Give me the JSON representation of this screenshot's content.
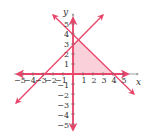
{
  "diagram": {
    "type": "coordinate-plane",
    "x_axis_label": "x",
    "y_axis_label": "y",
    "x_ticks": [
      "−5",
      "−4",
      "−3",
      "−2",
      "−1",
      "1",
      "2",
      "3",
      "4",
      "5"
    ],
    "y_ticks": [
      "5",
      "4",
      "3",
      "2",
      "1",
      "−1",
      "−2",
      "−3",
      "−4",
      "−5"
    ],
    "lines": [
      {
        "name": "rising-line",
        "equation": "y = x + 3"
      },
      {
        "name": "falling-line",
        "equation": "y = -x + 4"
      }
    ],
    "shaded_region": "x ≥ 0, y ≥ 0, y ≤ x + 3, y ≤ -x + 4",
    "colors": {
      "line": "#e8456a",
      "fill": "#f9c9d3",
      "axis": "#e8456a",
      "text": "#333333"
    }
  }
}
